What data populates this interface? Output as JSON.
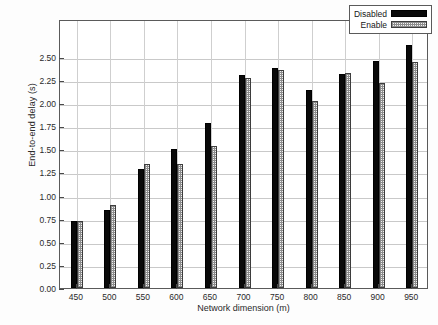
{
  "chart_data": {
    "type": "bar",
    "title": "",
    "xlabel": "Network dimension (m)",
    "ylabel": "End-to-end delay (s)",
    "categories": [
      "450",
      "500",
      "550",
      "600",
      "650",
      "700",
      "750",
      "800",
      "850",
      "900",
      "950"
    ],
    "series": [
      {
        "name": "Disabled",
        "color": "#090909",
        "fill": "solid-black",
        "values": [
          0.73,
          0.84,
          1.29,
          1.5,
          1.79,
          2.3,
          2.38,
          2.14,
          2.31,
          2.46,
          2.63
        ]
      },
      {
        "name": "Enable",
        "color": "#f2f2f2",
        "fill": "crosshatch-light",
        "values": [
          0.72,
          0.9,
          1.34,
          1.34,
          1.54,
          2.27,
          2.36,
          2.02,
          2.33,
          2.22,
          2.45
        ]
      }
    ],
    "ylim": [
      0.0,
      2.91
    ],
    "yticks": [
      "0.00",
      "0.25",
      "0.50",
      "0.75",
      "1.00",
      "1.25",
      "1.50",
      "1.75",
      "2.00",
      "2.25",
      "2.50"
    ],
    "ytick_values": [
      0.0,
      0.25,
      0.5,
      0.75,
      1.0,
      1.25,
      1.5,
      1.75,
      2.0,
      2.25,
      2.5
    ],
    "grid": "horizontal-and-vertical",
    "legend_position": "top-right",
    "legend_entries": [
      "Disabled",
      "Enable"
    ]
  }
}
